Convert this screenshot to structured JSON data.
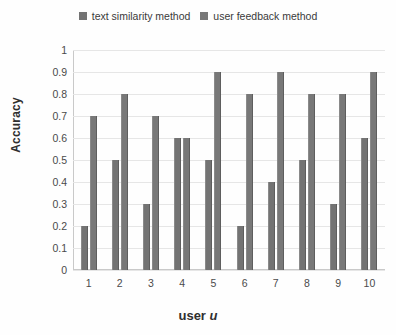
{
  "chart_data": {
    "type": "bar",
    "title": "",
    "xlabel": "user u",
    "ylabel": "Accuracy",
    "categories": [
      "1",
      "2",
      "3",
      "4",
      "5",
      "6",
      "7",
      "8",
      "9",
      "10"
    ],
    "series": [
      {
        "name": "text similarity method",
        "color": "#737373",
        "values": [
          0.2,
          0.5,
          0.3,
          0.6,
          0.5,
          0.2,
          0.4,
          0.5,
          0.3,
          0.6
        ]
      },
      {
        "name": "user feedback method",
        "color": "#787878",
        "values": [
          0.7,
          0.8,
          0.7,
          0.6,
          0.9,
          0.8,
          0.9,
          0.8,
          0.8,
          0.9
        ]
      }
    ],
    "ylim": [
      0,
      1
    ],
    "ytick_labels": [
      "1",
      "0.9",
      "0.8",
      "0.7",
      "0.6",
      "0.5",
      "0.4",
      "0.3",
      "0.2",
      "0.1",
      "0"
    ],
    "ytick_values": [
      1,
      0.9,
      0.8,
      0.7,
      0.6,
      0.5,
      0.4,
      0.3,
      0.2,
      0.1,
      0
    ],
    "grid": true,
    "legend_position": "top"
  },
  "legend": {
    "entries": [
      {
        "label": "text similarity method",
        "color": "#737373"
      },
      {
        "label": "user feedback method",
        "color": "#787878"
      }
    ]
  },
  "axes": {
    "x_title_text": "user",
    "x_title_var": "u",
    "y_title": "Accuracy"
  }
}
